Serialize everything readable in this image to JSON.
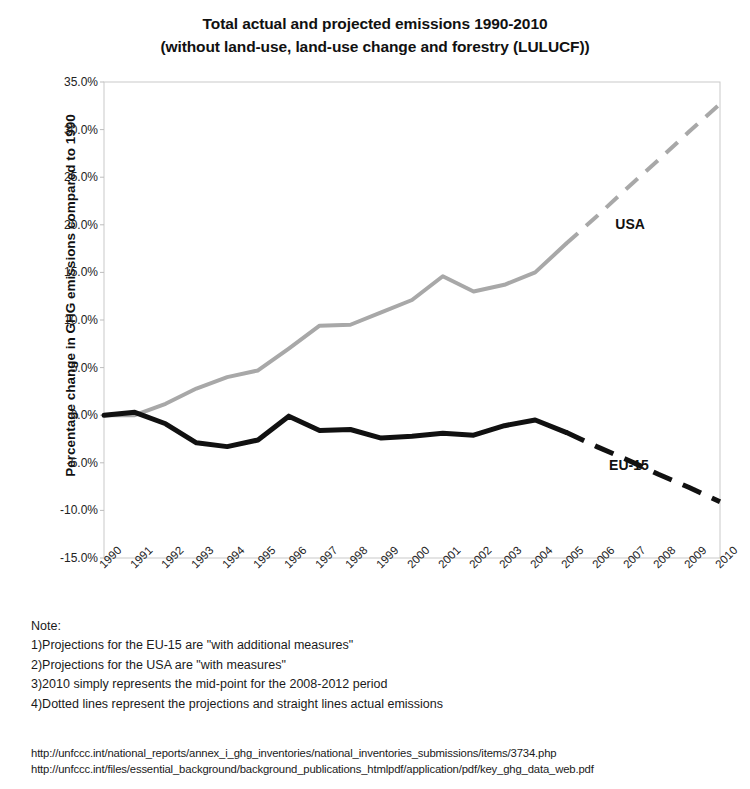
{
  "title": {
    "line1": "Total actual and projected emissions 1990-2010",
    "line2": "(without land-use, land-use change and forestry (LULUCF))"
  },
  "notes": {
    "heading": "Note:",
    "items": [
      "1)Projections for the EU-15 are \"with additional measures\"",
      "2)Projections for the USA are \"with measures\"",
      "3)2010 simply represents the mid-point for the 2008-2012 period",
      "4)Dotted lines represent the projections and straight lines actual emissions"
    ]
  },
  "sources": [
    "http://unfccc.int/national_reports/annex_i_ghg_inventories/national_inventories_submissions/items/3734.php",
    "http://unfccc.int/files/essential_background/background_publications_htmlpdf/application/pdf/key_ghg_data_web.pdf"
  ],
  "chart_data": {
    "type": "line",
    "title": "Total actual and projected emissions 1990-2010 (without land-use, land-use change and forestry (LULUCF))",
    "xlabel": "",
    "ylabel": "Percentage change in GHG emissions compared to 1990",
    "ylim": [
      -15.0,
      35.0
    ],
    "ytick_step": 5.0,
    "ytick_labels": [
      "35.0%",
      "30.0%",
      "25.0%",
      "20.0%",
      "15.0%",
      "10.0%",
      "5.0%",
      "0.0%",
      "-5.0%",
      "-10.0%",
      "-15.0%"
    ],
    "ytick_values": [
      35.0,
      30.0,
      25.0,
      20.0,
      15.0,
      10.0,
      5.0,
      0.0,
      -5.0,
      -10.0,
      -15.0
    ],
    "grid": false,
    "legend_position": "inline-annotation",
    "x": [
      1990,
      1991,
      1992,
      1993,
      1994,
      1995,
      1996,
      1997,
      1998,
      1999,
      2000,
      2001,
      2002,
      2003,
      2004,
      2005,
      2006,
      2007,
      2008,
      2009,
      2010
    ],
    "categories": [
      "1990",
      "1991",
      "1992",
      "1993",
      "1994",
      "1995",
      "1996",
      "1997",
      "1998",
      "1999",
      "2000",
      "2001",
      "2002",
      "2003",
      "2004",
      "2005",
      "2006",
      "2007",
      "2008",
      "2009",
      "2010"
    ],
    "series": [
      {
        "name": "USA",
        "color": "#a8a8a8",
        "style_actual": "solid",
        "style_projection": "dashed",
        "projection_starts_at": 2005,
        "values": [
          0.0,
          0.0,
          1.2,
          2.8,
          4.0,
          4.7,
          7.0,
          9.4,
          9.5,
          10.8,
          12.1,
          14.6,
          13.0,
          13.7,
          15.0,
          18.0,
          20.9,
          23.9,
          26.8,
          29.8,
          32.7
        ]
      },
      {
        "name": "EU-15",
        "color": "#111111",
        "style_actual": "solid",
        "style_projection": "dashed",
        "projection_starts_at": 2005,
        "values": [
          0.0,
          0.3,
          -0.9,
          -2.9,
          -3.3,
          -2.6,
          -0.1,
          -1.6,
          -1.5,
          -2.4,
          -2.2,
          -1.9,
          -2.1,
          -1.1,
          -0.5,
          -1.8,
          -3.3,
          -4.7,
          -6.2,
          -7.6,
          -9.1
        ]
      }
    ],
    "annotations": [
      {
        "text": "USA",
        "x": 2006.6,
        "y": 20.0
      },
      {
        "text": "EU-15",
        "x": 2006.4,
        "y": -5.3
      }
    ]
  }
}
